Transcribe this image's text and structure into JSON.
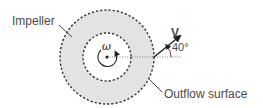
{
  "diagram": {
    "labels": {
      "impeller": "Impeller",
      "outflow_surface": "Outflow surface",
      "velocity": "V",
      "angle": "40°",
      "angular_velocity": "ω"
    },
    "geometry": {
      "center": [
        107,
        57
      ],
      "outer_radius": 47,
      "inner_radius": 24,
      "velocity_angle_deg": 40
    },
    "colors": {
      "annulus_fill": "#e3e3e3",
      "stroke": "#333333",
      "text": "#4a4a4a"
    }
  }
}
